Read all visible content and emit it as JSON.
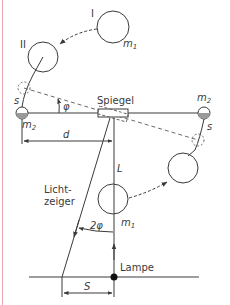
{
  "diagram": {
    "labels": {
      "position_one": "I",
      "position_two": "II",
      "mass_large_top": "m",
      "mass_large_top_sub": "1",
      "mass_large_bottom": "m",
      "mass_large_bottom_sub": "1",
      "mass_small_left": "m",
      "mass_small_left_sub": "2",
      "mass_small_right": "m",
      "mass_small_right_sub": "2",
      "displacement_left": "s",
      "displacement_right": "s",
      "angle_phi": "φ",
      "mirror": "Spiegel",
      "distance_d": "d",
      "length_L": "L",
      "light_pointer_line1": "Licht-",
      "light_pointer_line2": "zeiger",
      "angle_two_phi": "2φ",
      "lamp": "Lampe",
      "deflection_S": "S"
    },
    "colors": {
      "stroke": "#3a3a3a",
      "border": "#e8a9b3",
      "background": "#ffffff"
    }
  }
}
